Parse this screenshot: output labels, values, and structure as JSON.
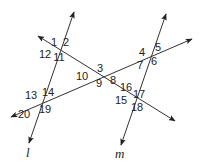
{
  "diagram": {
    "lines": [
      {
        "id": "l",
        "label": "l",
        "from": [
          29,
          143
        ],
        "to": [
          74,
          12
        ],
        "label_pos": [
          26,
          157
        ]
      },
      {
        "id": "m",
        "label": "m",
        "from": [
          121,
          145
        ],
        "to": [
          166,
          14
        ],
        "label_pos": [
          115,
          158
        ]
      },
      {
        "id": "t1",
        "label": "",
        "from": [
          38,
          36
        ],
        "to": [
          175,
          121
        ]
      },
      {
        "id": "t2",
        "label": "",
        "from": [
          11,
          117
        ],
        "to": [
          192,
          39
        ]
      }
    ],
    "angles": [
      {
        "n": "1",
        "pos": [
          54,
          46
        ]
      },
      {
        "n": "2",
        "pos": [
          66,
          46
        ]
      },
      {
        "n": "3",
        "pos": [
          100,
          72
        ]
      },
      {
        "n": "4",
        "pos": [
          142,
          56
        ]
      },
      {
        "n": "5",
        "pos": [
          158,
          51
        ]
      },
      {
        "n": "6",
        "pos": [
          154,
          65
        ]
      },
      {
        "n": "7",
        "pos": [
          140,
          69
        ]
      },
      {
        "n": "8",
        "pos": [
          113,
          84
        ]
      },
      {
        "n": "9",
        "pos": [
          99,
          87
        ]
      },
      {
        "n": "10",
        "pos": [
          82,
          80
        ]
      },
      {
        "n": "11",
        "pos": [
          59,
          61
        ]
      },
      {
        "n": "12",
        "pos": [
          45,
          58
        ]
      },
      {
        "n": "13",
        "pos": [
          31,
          99
        ]
      },
      {
        "n": "14",
        "pos": [
          48,
          96
        ]
      },
      {
        "n": "15",
        "pos": [
          121,
          104
        ]
      },
      {
        "n": "16",
        "pos": [
          126,
          91
        ]
      },
      {
        "n": "17",
        "pos": [
          139,
          98
        ]
      },
      {
        "n": "18",
        "pos": [
          137,
          111
        ]
      },
      {
        "n": "19",
        "pos": [
          45,
          113
        ]
      },
      {
        "n": "20",
        "pos": [
          24,
          118
        ]
      }
    ]
  }
}
